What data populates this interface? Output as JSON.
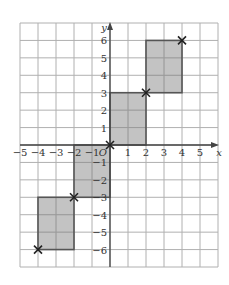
{
  "diagram": {
    "type": "coordinate-grid",
    "axes": {
      "x_label": "x",
      "y_label": "y",
      "x_range": [
        -5,
        6
      ],
      "y_range": [
        -7,
        7
      ],
      "x_ticks": [
        -5,
        -4,
        -3,
        -2,
        -1,
        1,
        2,
        3,
        4,
        5
      ],
      "y_ticks": [
        -6,
        -5,
        -4,
        -3,
        -2,
        -1,
        1,
        2,
        3,
        4,
        5,
        6
      ],
      "origin_label": "O"
    },
    "tick_labels": {
      "x": [
        "−5",
        "−4",
        "−3",
        "−2",
        "−1",
        "1",
        "2",
        "3",
        "4",
        "5"
      ],
      "y": [
        "6",
        "5",
        "4",
        "3",
        "2",
        "1",
        "−1",
        "−2",
        "−3",
        "−4",
        "−5",
        "−6"
      ]
    },
    "rectangles": [
      {
        "x1": -4,
        "y1": -6,
        "x2": -2,
        "y2": -3
      },
      {
        "x1": -2,
        "y1": -3,
        "x2": 0,
        "y2": 0
      },
      {
        "x1": 0,
        "y1": 0,
        "x2": 2,
        "y2": 3
      },
      {
        "x1": 2,
        "y1": 3,
        "x2": 4,
        "y2": 6
      }
    ],
    "crosses": [
      {
        "x": -4,
        "y": -6
      },
      {
        "x": -2,
        "y": -3
      },
      {
        "x": 0,
        "y": 0
      },
      {
        "x": 2,
        "y": 3
      },
      {
        "x": 4,
        "y": 6
      }
    ],
    "colors": {
      "grid": "#b0b0b0",
      "axis": "#444444",
      "shape_fill": "#b8b8b8",
      "shape_stroke": "#555555",
      "cross": "#222222"
    }
  }
}
